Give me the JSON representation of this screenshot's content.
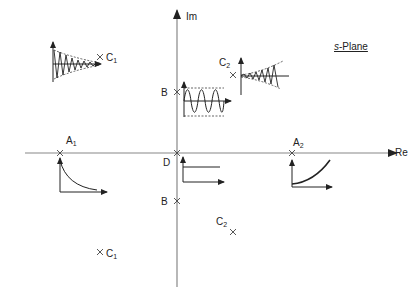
{
  "diagram": {
    "title_prefix": "s",
    "title_suffix": "-Plane",
    "axes": {
      "imaginary_label": "Im",
      "real_label": "Re"
    },
    "poles": [
      {
        "id": "A1",
        "letter": "A",
        "sub": "1",
        "x": 60,
        "y": 153,
        "response": "decaying exponential"
      },
      {
        "id": "A2",
        "letter": "A",
        "sub": "2",
        "x": 292,
        "y": 153,
        "response": "growing exponential"
      },
      {
        "id": "B_upper",
        "letter": "B",
        "sub": "",
        "x": 177,
        "y": 92,
        "response": "sustained oscillation"
      },
      {
        "id": "B_lower",
        "letter": "B",
        "sub": "",
        "x": 177,
        "y": 201,
        "response": ""
      },
      {
        "id": "C1_upper",
        "letter": "C",
        "sub": "1",
        "x": 100,
        "y": 57,
        "response": "damped oscillation"
      },
      {
        "id": "C1_lower",
        "letter": "C",
        "sub": "1",
        "x": 100,
        "y": 252,
        "response": ""
      },
      {
        "id": "C2_upper",
        "letter": "C",
        "sub": "2",
        "x": 233,
        "y": 75,
        "response": "growing oscillation"
      },
      {
        "id": "C2_lower",
        "letter": "C",
        "sub": "2",
        "x": 233,
        "y": 232,
        "response": ""
      },
      {
        "id": "D",
        "letter": "D",
        "sub": "",
        "x": 177,
        "y": 153,
        "response": "constant (step)"
      }
    ],
    "colors": {
      "axis": "#888888",
      "curve": "#222222",
      "text": "#222222"
    }
  }
}
